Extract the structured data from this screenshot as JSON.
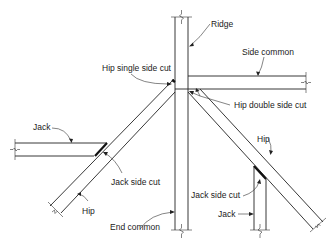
{
  "diagram": {
    "labels": {
      "ridge": "Ridge",
      "side_common": "Side common",
      "hip_single_side_cut": "Hip single side cut",
      "hip_double_side_cut": "Hip double side cut",
      "jack_left": "Jack",
      "jack_side_cut_left": "Jack side cut",
      "hip_left": "Hip",
      "end_common": "End common",
      "hip_right": "Hip",
      "jack_side_cut_right": "Jack side cut",
      "jack_right": "Jack"
    },
    "members": [
      {
        "name": "Ridge",
        "orientation": "vertical"
      },
      {
        "name": "Side common",
        "orientation": "horizontal"
      },
      {
        "name": "Hip (left)",
        "orientation": "diagonal"
      },
      {
        "name": "Hip (right)",
        "orientation": "diagonal"
      },
      {
        "name": "Jack (left)",
        "orientation": "horizontal"
      },
      {
        "name": "Jack (right)",
        "orientation": "vertical"
      },
      {
        "name": "End common",
        "orientation": "vertical"
      }
    ]
  }
}
